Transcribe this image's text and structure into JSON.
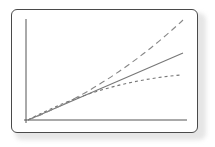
{
  "diagram": {
    "type": "line-divergence",
    "colors": {
      "frame": "#4a4a4a",
      "axis": "#555555",
      "line": "#777777",
      "background": "#ffffff"
    },
    "axes": {
      "x_label": "",
      "y_label": ""
    },
    "series": [
      {
        "name": "upper",
        "style": "long-dashed",
        "trend": "accelerating"
      },
      {
        "name": "middle",
        "style": "solid",
        "trend": "linear"
      },
      {
        "name": "lower",
        "style": "short-dashed",
        "trend": "decelerating"
      }
    ]
  }
}
